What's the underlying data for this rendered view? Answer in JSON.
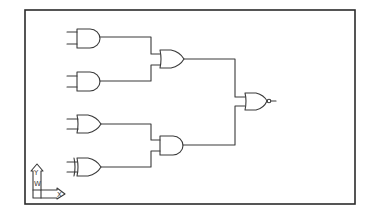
{
  "diagram": {
    "gates": [
      {
        "id": "g1",
        "type": "AND",
        "inputs": 2
      },
      {
        "id": "g2",
        "type": "AND",
        "inputs": 2
      },
      {
        "id": "g3",
        "type": "OR",
        "inputs": 2,
        "from": [
          "g1",
          "g2"
        ]
      },
      {
        "id": "g4",
        "type": "OR",
        "inputs": 2
      },
      {
        "id": "g5",
        "type": "XOR",
        "inputs": 2
      },
      {
        "id": "g6",
        "type": "AND",
        "inputs": 2,
        "from": [
          "g4",
          "g5"
        ]
      },
      {
        "id": "g7",
        "type": "NOR",
        "inputs": 2,
        "from": [
          "g3",
          "g6"
        ],
        "output": true
      }
    ],
    "ucs_icon": {
      "y_label": "Y",
      "x_label": "X",
      "w_label": "W"
    }
  }
}
